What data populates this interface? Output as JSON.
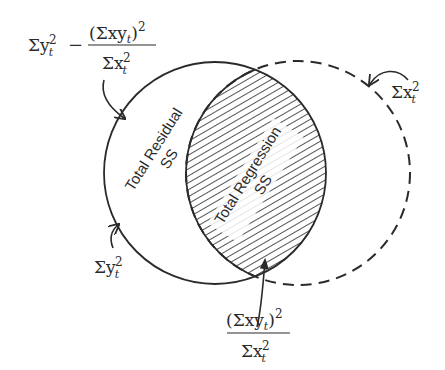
{
  "diagram": {
    "type": "venn",
    "circles": {
      "y_circle": {
        "label_sum": "Σy",
        "label_sub": "t",
        "label_sup": "2",
        "style": "solid"
      },
      "x_circle": {
        "label_sum": "Σx",
        "label_sub": "t",
        "label_sup": "2",
        "style": "dashed"
      }
    },
    "regions": {
      "residual": {
        "line1": "Total Residual",
        "line2": "SS"
      },
      "regression": {
        "line1": "Total Regression",
        "line2": "SS"
      }
    },
    "formulas": {
      "residual_formula": {
        "lead_sum": "Σy",
        "lead_sub": "t",
        "lead_sup": "2",
        "minus": "−",
        "numerator_open": "(Σxy",
        "numerator_sub": "t",
        "numerator_close": ")",
        "numerator_sup": "2",
        "denominator_sum": "Σx",
        "denominator_sub": "t",
        "denominator_sup": "2"
      },
      "regression_formula": {
        "numerator_open": "(Σxy",
        "numerator_sub": "t",
        "numerator_close": ")",
        "numerator_sup": "2",
        "denominator_sum": "Σx",
        "denominator_sub": "t",
        "denominator_sup": "2"
      }
    },
    "colors": {
      "ink": "#2a2a2a",
      "background": "#ffffff"
    }
  }
}
